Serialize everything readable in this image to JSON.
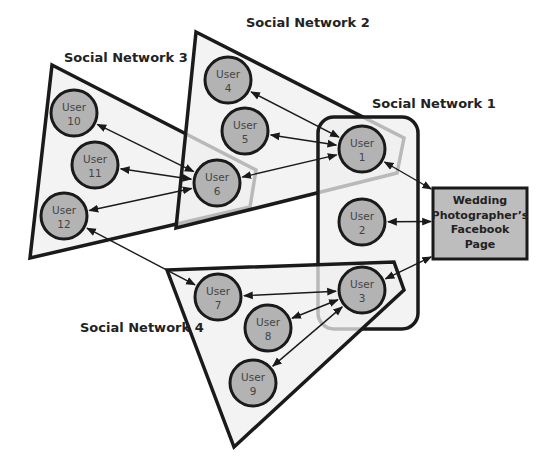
{
  "diagram": {
    "networks": [
      {
        "id": "sn3",
        "label": "Social Network 3",
        "label_x": 64,
        "label_y": 62,
        "points": "52,65 256,170 250,207 30,258"
      },
      {
        "id": "sn2",
        "label": "Social Network 2",
        "label_x": 246,
        "label_y": 27,
        "points": "196,32 404,138 397,173 176,228"
      },
      {
        "id": "sn1",
        "label": "Social Network 1",
        "label_x": 372,
        "label_y": 108,
        "rect": {
          "x": 318,
          "y": 117,
          "w": 100,
          "h": 212,
          "r": 16
        }
      },
      {
        "id": "sn4",
        "label": "Social Network 4",
        "label_x": 80,
        "label_y": 332,
        "points": "167,270 394,262 404,290 234,447"
      }
    ],
    "nodes": [
      {
        "id": "u1",
        "line1": "User",
        "line2": "1",
        "cx": 362,
        "cy": 149
      },
      {
        "id": "u2",
        "line1": "User",
        "line2": "2",
        "cx": 362,
        "cy": 222
      },
      {
        "id": "u3",
        "line1": "User",
        "line2": "3",
        "cx": 362,
        "cy": 290
      },
      {
        "id": "u4",
        "line1": "User",
        "line2": "4",
        "cx": 228,
        "cy": 80
      },
      {
        "id": "u5",
        "line1": "User",
        "line2": "5",
        "cx": 245,
        "cy": 131
      },
      {
        "id": "u6",
        "line1": "User",
        "line2": "6",
        "cx": 217,
        "cy": 183
      },
      {
        "id": "u7",
        "line1": "User",
        "line2": "7",
        "cx": 218,
        "cy": 297
      },
      {
        "id": "u8",
        "line1": "User",
        "line2": "8",
        "cx": 268,
        "cy": 328
      },
      {
        "id": "u9",
        "line1": "User",
        "line2": "9",
        "cx": 253,
        "cy": 383
      },
      {
        "id": "u10",
        "line1": "User",
        "line2": "10",
        "cx": 74,
        "cy": 113
      },
      {
        "id": "u11",
        "line1": "User",
        "line2": "11",
        "cx": 95,
        "cy": 165
      },
      {
        "id": "u12",
        "line1": "User",
        "line2": "12",
        "cx": 64,
        "cy": 216
      }
    ],
    "target": {
      "lines": [
        "Wedding",
        "Photographer’s",
        "Facebook",
        "Page"
      ],
      "x": 433,
      "y": 188,
      "w": 94,
      "h": 71
    },
    "edges": [
      [
        "u4",
        "u1"
      ],
      [
        "u5",
        "u1"
      ],
      [
        "u6",
        "u1"
      ],
      [
        "u10",
        "u6"
      ],
      [
        "u11",
        "u6"
      ],
      [
        "u12",
        "u6"
      ],
      [
        "u12",
        "u7"
      ],
      [
        "u7",
        "u3"
      ],
      [
        "u8",
        "u3"
      ],
      [
        "u9",
        "u3"
      ],
      [
        "u1",
        "target"
      ],
      [
        "u2",
        "target"
      ],
      [
        "u3",
        "target"
      ]
    ],
    "node_radius": 23
  }
}
